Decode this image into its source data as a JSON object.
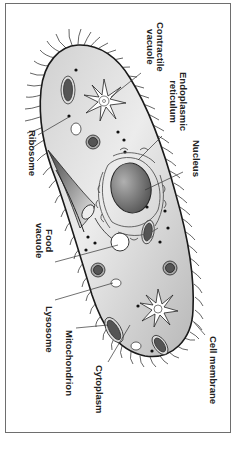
{
  "diagram": {
    "labels": {
      "contractile_vacuole": [
        "Contractile",
        "vacuole"
      ],
      "endoplasmic_reticulum": [
        "Endoplasmic",
        "reticulum"
      ],
      "nucleus": "Nucleus",
      "ribosome": "Ribosome",
      "food_vacuole": [
        "Food",
        "vacuole"
      ],
      "lysosome": "Lysosome",
      "mitochondrion": "Mitochondrion",
      "cytoplasm": "Cytoplasm",
      "cell_membrane": "Cell membrane"
    },
    "colors": {
      "cytoplasm_light": "#e4e4e4",
      "cytoplasm_dark": "#b5b5b5",
      "outline": "#1a1a1a",
      "nucleus": "#707070",
      "organelle_dark": "#5a5a5a",
      "frame": "#6e6e6e"
    }
  }
}
